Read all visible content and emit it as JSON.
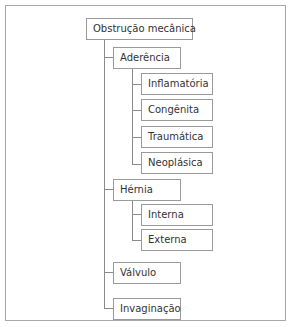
{
  "diagram": {
    "type": "tree",
    "root": {
      "label": "Obstrução mecânica",
      "children": [
        {
          "label": "Aderência",
          "children": [
            {
              "label": "Inflamatória"
            },
            {
              "label": "Congênita"
            },
            {
              "label": "Traumática"
            },
            {
              "label": "Neoplásica"
            }
          ]
        },
        {
          "label": "Hérnia",
          "children": [
            {
              "label": "Interna"
            },
            {
              "label": "Externa"
            }
          ]
        },
        {
          "label": "Válvulo"
        },
        {
          "label": "Invaginação"
        }
      ]
    },
    "colors": {
      "border": "#9a9a9a",
      "line": "#8a8a8a",
      "text": "#333333",
      "background": "#ffffff"
    }
  }
}
